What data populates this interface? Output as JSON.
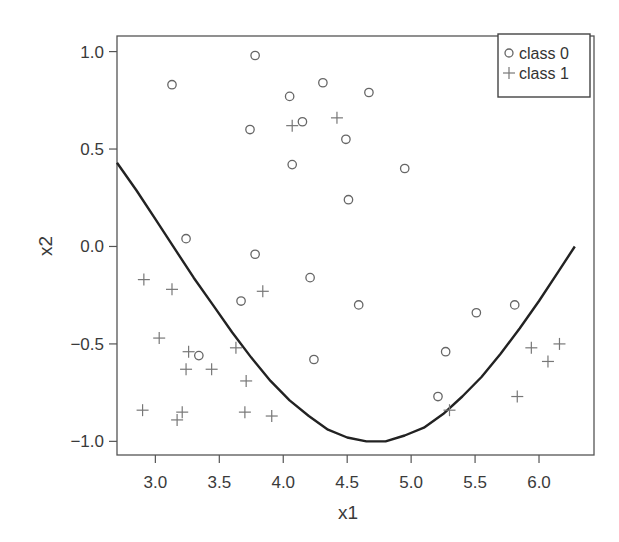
{
  "chart_data": {
    "type": "scatter",
    "title": "",
    "xlabel": "x1",
    "ylabel": "x2",
    "xlim": [
      2.7,
      6.43
    ],
    "ylim": [
      -1.07,
      1.08
    ],
    "xticks": [
      3.0,
      3.5,
      4.0,
      4.5,
      5.0,
      5.5,
      6.0
    ],
    "xtick_labels": [
      "3.0",
      "3.5",
      "4.0",
      "4.5",
      "5.0",
      "5.5",
      "6.0"
    ],
    "yticks": [
      1.0,
      0.5,
      0.0,
      -0.5,
      -1.0
    ],
    "ytick_labels": [
      "1.0",
      "0.5",
      "0.0",
      "−0.5",
      "−1.0"
    ],
    "grid": false,
    "legend": {
      "position": "top-right",
      "entries": [
        {
          "label": "class 0",
          "marker": "circle"
        },
        {
          "label": "class 1",
          "marker": "plus"
        }
      ]
    },
    "series": [
      {
        "name": "class 0",
        "marker": "circle",
        "color": "#666666",
        "points": [
          [
            3.13,
            0.83
          ],
          [
            3.78,
            0.98
          ],
          [
            3.74,
            0.6
          ],
          [
            4.05,
            0.77
          ],
          [
            4.31,
            0.84
          ],
          [
            4.67,
            0.79
          ],
          [
            4.15,
            0.64
          ],
          [
            4.49,
            0.55
          ],
          [
            4.07,
            0.42
          ],
          [
            4.95,
            0.4
          ],
          [
            4.51,
            0.24
          ],
          [
            3.24,
            0.04
          ],
          [
            3.78,
            -0.04
          ],
          [
            3.67,
            -0.28
          ],
          [
            4.21,
            -0.16
          ],
          [
            4.59,
            -0.3
          ],
          [
            4.24,
            -0.58
          ],
          [
            3.34,
            -0.56
          ],
          [
            5.51,
            -0.34
          ],
          [
            5.81,
            -0.3
          ],
          [
            5.27,
            -0.54
          ],
          [
            5.21,
            -0.77
          ]
        ]
      },
      {
        "name": "class 1",
        "marker": "plus",
        "color": "#777777",
        "points": [
          [
            4.07,
            0.62
          ],
          [
            4.42,
            0.66
          ],
          [
            2.91,
            -0.17
          ],
          [
            3.13,
            -0.22
          ],
          [
            3.84,
            -0.23
          ],
          [
            3.03,
            -0.47
          ],
          [
            3.26,
            -0.54
          ],
          [
            3.24,
            -0.63
          ],
          [
            3.44,
            -0.63
          ],
          [
            3.63,
            -0.52
          ],
          [
            3.71,
            -0.69
          ],
          [
            2.9,
            -0.84
          ],
          [
            3.21,
            -0.85
          ],
          [
            3.17,
            -0.89
          ],
          [
            3.7,
            -0.85
          ],
          [
            3.91,
            -0.87
          ],
          [
            5.3,
            -0.84
          ],
          [
            5.94,
            -0.52
          ],
          [
            6.16,
            -0.5
          ],
          [
            6.07,
            -0.59
          ],
          [
            5.83,
            -0.77
          ]
        ]
      }
    ],
    "boundary": {
      "name": "decision boundary",
      "color": "#222222",
      "points": [
        [
          2.7,
          0.43
        ],
        [
          2.85,
          0.29
        ],
        [
          3.0,
          0.14
        ],
        [
          3.15,
          -0.01
        ],
        [
          3.3,
          -0.16
        ],
        [
          3.45,
          -0.3
        ],
        [
          3.6,
          -0.44
        ],
        [
          3.75,
          -0.57
        ],
        [
          3.9,
          -0.69
        ],
        [
          4.05,
          -0.79
        ],
        [
          4.2,
          -0.87
        ],
        [
          4.35,
          -0.94
        ],
        [
          4.5,
          -0.98
        ],
        [
          4.65,
          -1.0
        ],
        [
          4.71,
          -1.0
        ],
        [
          4.8,
          -1.0
        ],
        [
          4.95,
          -0.97
        ],
        [
          5.1,
          -0.93
        ],
        [
          5.25,
          -0.86
        ],
        [
          5.4,
          -0.77
        ],
        [
          5.55,
          -0.67
        ],
        [
          5.7,
          -0.55
        ],
        [
          5.85,
          -0.42
        ],
        [
          6.0,
          -0.28
        ],
        [
          6.15,
          -0.13
        ],
        [
          6.28,
          0.0
        ]
      ]
    }
  }
}
